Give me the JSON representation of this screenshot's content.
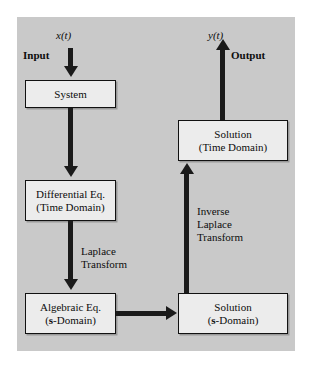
{
  "figure": {
    "panel_color": "#c9c9c9",
    "box_fill": "#ececec",
    "line_color": "#1a1a1a"
  },
  "labels": {
    "input_signal": "x(t)",
    "input": "Input",
    "output_signal": "y(t)",
    "output": "Output",
    "laplace_transform_line1": "Laplace",
    "laplace_transform_line2": "Transform",
    "inverse_line1": "Inverse",
    "inverse_line2": "Laplace",
    "inverse_line3": "Transform"
  },
  "nodes": {
    "system": {
      "line1": "System",
      "line2": ""
    },
    "differential_eq": {
      "line1": "Differential Eq.",
      "line2": "(Time Domain)"
    },
    "algebraic_eq": {
      "line1": "Algebraic Eq.",
      "line2_prefix": "(",
      "line2_bold": "s",
      "line2_suffix": "-Domain)"
    },
    "solution_time": {
      "line1": "Solution",
      "line2": "(Time Domain)"
    },
    "solution_s": {
      "line1": "Solution",
      "line2_prefix": "(",
      "line2_bold": "s",
      "line2_suffix": "-Domain)"
    }
  },
  "edges": {
    "input_to_system": "arrow-down",
    "system_to_differential": "arrow-down",
    "differential_to_algebraic": "arrow-down",
    "algebraic_to_solution_s": "arrow-right",
    "solution_s_to_solution_time": "arrow-up",
    "solution_time_to_output": "arrow-up"
  }
}
